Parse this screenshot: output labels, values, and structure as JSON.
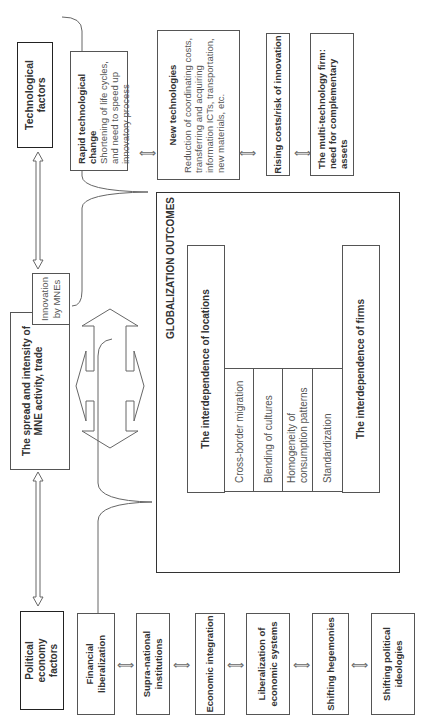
{
  "technological": {
    "title": "Technological factors",
    "items": [
      {
        "title": "Rapid technological change",
        "desc": "Shortening of life cycles, and need to speed up innovatory process"
      },
      {
        "title": "New technologies",
        "desc": "Reduction of coordinating costs, transferring and acquiring information ICTs, transportation, new materials, etc."
      },
      {
        "title": "Rising costs/risk of innovation",
        "desc": ""
      },
      {
        "title": "The multi-technology firm: need for complementary assets",
        "desc": ""
      }
    ]
  },
  "political": {
    "title": "Political economy factors",
    "items": [
      "Financial liberalization",
      "Supra-national institutions",
      "Economic integration",
      "Liberalization of economic systems",
      "Shifting hegemonies",
      "Shifting political ideologies"
    ]
  },
  "mne": {
    "title": "The spread and intensity of MNE activity, trade",
    "innovation": "Innovation by MNEs"
  },
  "outcomes": {
    "title": "GLOBALIZATION OUTCOMES",
    "locations": "The interdependence of locations",
    "firms": "The interdependence of firms",
    "middle": [
      "Cross-border migration",
      "Blending of cultures",
      "Homogeneity of consumption patterns",
      "Standardization"
    ]
  },
  "symbols": {
    "bidirectional": "⟺"
  }
}
